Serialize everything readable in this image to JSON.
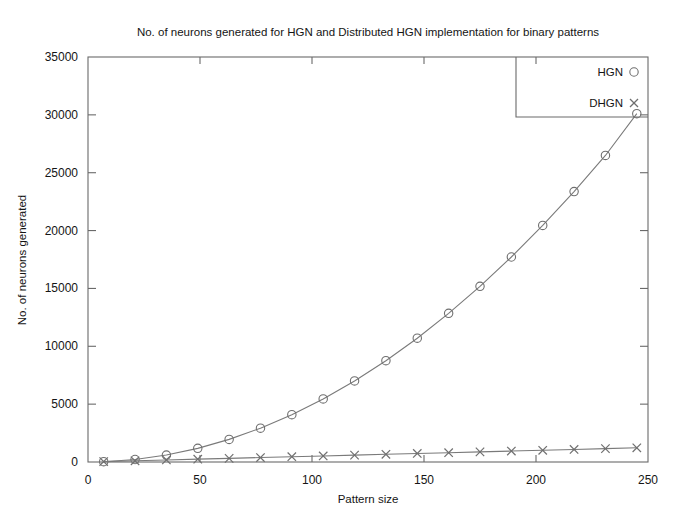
{
  "chart_data": {
    "type": "line",
    "title": "No. of neurons generated for HGN and Distributed HGN implementation for binary patterns",
    "xlabel": "Pattern size",
    "ylabel": "No. of neurons generated",
    "xlim": [
      0,
      250
    ],
    "ylim": [
      0,
      35000
    ],
    "xticks": [
      0,
      50,
      100,
      150,
      200,
      250
    ],
    "yticks": [
      0,
      5000,
      10000,
      15000,
      20000,
      25000,
      30000,
      35000
    ],
    "xticklabels": [
      "0",
      "50",
      "100",
      "150",
      "200",
      "250"
    ],
    "yticklabels": [
      "0",
      "5000",
      "10000",
      "15000",
      "20000",
      "25000",
      "30000",
      "35000"
    ],
    "grid": false,
    "legend_position": "top-right",
    "x": [
      7,
      21,
      35,
      49,
      63,
      77,
      91,
      105,
      119,
      133,
      147,
      161,
      175,
      189,
      203,
      217,
      231,
      245
    ],
    "series": [
      {
        "name": "HGN",
        "marker": "circle",
        "values": [
          25,
          215,
          600,
          1180,
          1955,
          2925,
          4090,
          5450,
          7005,
          8755,
          10700,
          12845,
          15180,
          17715,
          20445,
          23370,
          26490,
          30100
        ]
      },
      {
        "name": "DHGN",
        "marker": "x",
        "values": [
          35,
          105,
          175,
          245,
          315,
          385,
          455,
          525,
          595,
          665,
          735,
          805,
          875,
          945,
          1015,
          1085,
          1155,
          1225
        ]
      }
    ],
    "legend": [
      {
        "label": "HGN",
        "marker": "circle"
      },
      {
        "label": "DHGN",
        "marker": "x"
      }
    ],
    "colors": {
      "hgn_line": "#7a7a7a",
      "dhgn_line": "#7a7a7a",
      "axis": "#6a6a6a",
      "text": "#151515",
      "background": "#ffffff"
    },
    "plot_area": {
      "left": 88,
      "right": 648,
      "top": 57,
      "bottom": 462
    }
  }
}
